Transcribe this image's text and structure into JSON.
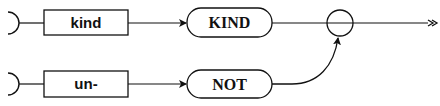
{
  "diagram": {
    "type": "syntax-railroad-diagram",
    "rows": [
      {
        "nonterminal": "kind",
        "terminal": "KIND"
      },
      {
        "nonterminal": "un-",
        "terminal": "NOT"
      }
    ],
    "colors": {
      "stroke": "#111111",
      "background": "#ffffff"
    }
  }
}
